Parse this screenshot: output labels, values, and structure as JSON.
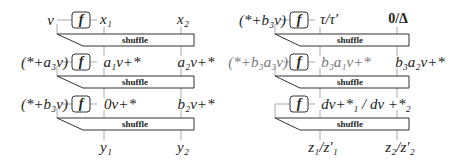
{
  "left_panel": {
    "rows": [
      {
        "input_label": "v",
        "col1": "x₁",
        "col2": "x₂"
      },
      {
        "input_label": "(*+a₃v)",
        "col1": "a₁v+*",
        "col2": "a₂v+*"
      },
      {
        "input_label": "(*+b₃v)",
        "col1": "0v+*",
        "col2": "b₂v+*"
      }
    ],
    "outputs": {
      "col1": "y₁",
      "col2": "y₂"
    },
    "function_label": "f",
    "shuffle_label": "shuffle"
  },
  "right_panel": {
    "rows": [
      {
        "input_label": "(*+b₃v)",
        "col1": "τ/τ'",
        "col2": "0/Δ"
      },
      {
        "input_label": "(*+b₃a₃v)",
        "col1": "b₃a₁v+*",
        "col2": "b₃a₂v+*"
      },
      {
        "input_label": "",
        "col1": "dv+*₁ / dv +*₂",
        "col2": ""
      }
    ],
    "outputs": {
      "col1": "z₁/z'₁",
      "col2": "z₂/z'₂"
    },
    "function_label": "f",
    "shuffle_label": "shuffle"
  },
  "colors": {
    "line": "#333333",
    "connector": "#aaaaaa",
    "text": "#222222"
  }
}
